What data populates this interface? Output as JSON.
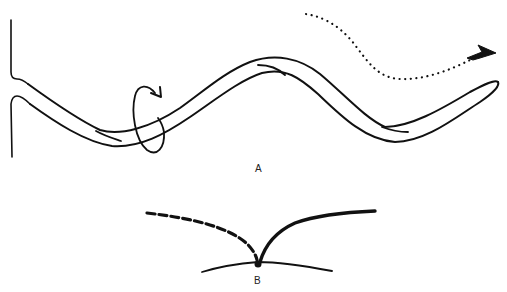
{
  "figure": {
    "panels": [
      {
        "id": "A",
        "label": "A",
        "description": "Elongated worm-like body emerging from a surface, with a rotation arrow ring around it and a dotted arrow path showing direction of movement"
      },
      {
        "id": "B",
        "label": "B",
        "description": "Point on a surface with a dashed curved path and a solid curved path diverging from it"
      }
    ],
    "elements": {
      "rotation_arrow": "ring with arrowhead indicating rotation about the long axis",
      "motion_path": "dotted sinuous path ending in arrowhead",
      "dashed_path": "dashed curve (previous path)",
      "solid_path": "solid curve (new path)",
      "origin_point": "filled dot at surface"
    },
    "colors": {
      "ink": "#111111",
      "background": "#ffffff"
    }
  }
}
